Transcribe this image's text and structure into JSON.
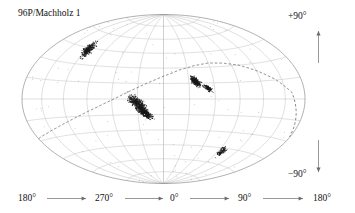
{
  "figure": {
    "title": "96P/Machholz 1",
    "projection": "hammer-aitoff",
    "background_color": "#ffffff",
    "grid_color": "#b9b9b9",
    "outline_color": "#8d8d8d",
    "track_color": "#555555",
    "point_color": "#1a1a1a",
    "text_color": "#111111"
  },
  "labels": {
    "north_pole": "+90°",
    "south_pole": "−90°",
    "longitude_axis": [
      "180°",
      "270°",
      "0°",
      "90°",
      "180°"
    ]
  },
  "icons": {
    "arrow_up": "arrow-up-icon",
    "arrow_down": "arrow-down-icon",
    "arrow_right": "arrow-right-icon"
  },
  "chart_data": {
    "type": "scatter",
    "title": "96P/Machholz 1",
    "xlabel": "",
    "ylabel": "",
    "projection": "hammer-aitoff",
    "grid": true,
    "legend": false,
    "xlim": [
      180,
      -180
    ],
    "ylim": [
      -90,
      90
    ],
    "xticks": [
      180,
      270,
      0,
      90,
      180
    ],
    "xticklabels": [
      "180°",
      "270°",
      "0°",
      "90°",
      "180°"
    ],
    "yticklabels": [
      "+90°",
      "−90°"
    ],
    "grid_spacing_deg": {
      "longitude": 30,
      "latitude": 15
    },
    "annotations": [
      {
        "text": "96P/Machholz 1",
        "position": "top-left"
      },
      {
        "text": "+90°",
        "position": "top-right"
      },
      {
        "text": "−90°",
        "position": "bottom-right"
      }
    ],
    "series": [
      {
        "name": "orbit-track",
        "type": "line",
        "style": "dashed",
        "description": "Great-circle orbital plane track of comet 96P/Machholz 1 crossing the sky map",
        "points_lonlat": [
          [
            180,
            -28
          ],
          [
            160,
            -26
          ],
          [
            140,
            -23
          ],
          [
            120,
            -19
          ],
          [
            100,
            -14
          ],
          [
            80,
            -8
          ],
          [
            60,
            -1
          ],
          [
            40,
            7
          ],
          [
            20,
            15
          ],
          [
            0,
            22
          ],
          [
            -20,
            28
          ],
          [
            -40,
            32
          ],
          [
            -60,
            34
          ],
          [
            -80,
            33
          ],
          [
            -100,
            30
          ],
          [
            -120,
            24
          ],
          [
            -140,
            16
          ],
          [
            -160,
            5
          ],
          [
            -180,
            -28
          ]
        ]
      },
      {
        "name": "radiant-cluster-1",
        "type": "points",
        "description": "Dense northern cluster (Quadrantid-like branch)",
        "center_lonlat": [
          118,
          43
        ],
        "n_points": 320,
        "spread_deg": [
          7,
          5
        ]
      },
      {
        "name": "radiant-cluster-2",
        "type": "points",
        "description": "Elongated mid-sky cluster along the orbital track",
        "center_lonlat": [
          30,
          -4
        ],
        "n_points": 420,
        "spread_deg": [
          11,
          4
        ]
      },
      {
        "name": "radiant-cluster-3",
        "type": "points",
        "description": "Second elongated cluster just below the track",
        "center_lonlat": [
          22,
          -13
        ],
        "n_points": 380,
        "spread_deg": [
          9,
          3
        ]
      },
      {
        "name": "radiant-cluster-4",
        "type": "points",
        "description": "Compact dense cluster near the ecliptic crossing",
        "center_lonlat": [
          -38,
          17
        ],
        "n_points": 300,
        "spread_deg": [
          6,
          3
        ]
      },
      {
        "name": "radiant-cluster-5",
        "type": "points",
        "description": "Smaller companion cluster east of cluster 4",
        "center_lonlat": [
          -52,
          10
        ],
        "n_points": 140,
        "spread_deg": [
          5,
          2
        ]
      },
      {
        "name": "radiant-cluster-6",
        "type": "points",
        "description": "Southern sparse cluster",
        "center_lonlat": [
          -96,
          -48
        ],
        "n_points": 110,
        "spread_deg": [
          5,
          4
        ]
      },
      {
        "name": "sporadic-background",
        "type": "points",
        "description": "Scattered isolated radiants across the sky",
        "n_points": 90,
        "spread_deg": [
          180,
          90
        ]
      }
    ]
  }
}
